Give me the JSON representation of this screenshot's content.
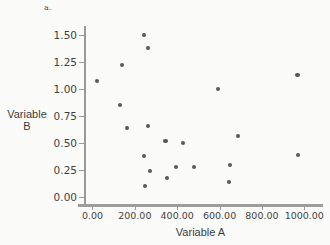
{
  "panel": {
    "label": "a."
  },
  "chart_data": {
    "type": "scatter",
    "title": "",
    "panel_label": "a.",
    "xlabel": "Variable A",
    "ylabel": "Variable B",
    "xlim": [
      -40,
      1060
    ],
    "ylim": [
      -0.06,
      1.58
    ],
    "grid": false,
    "legend": null,
    "point_color": "#585858",
    "axis_color": "#9a9a9a",
    "background_color": "#fbfbfa",
    "xticks": [
      0,
      200,
      400,
      600,
      800,
      1000
    ],
    "xtick_labels": [
      "0.00",
      "200.00",
      "400.00",
      "600.00",
      "800.00",
      "1000.00"
    ],
    "yticks": [
      0.0,
      0.25,
      0.5,
      0.75,
      1.0,
      1.25,
      1.5
    ],
    "ytick_labels": [
      "0.00",
      "0.25",
      "0.50",
      "0.75",
      "1.00",
      "1.25",
      "1.50"
    ],
    "points": [
      {
        "x": 20,
        "y": 1.07
      },
      {
        "x": 140,
        "y": 1.22
      },
      {
        "x": 130,
        "y": 0.85
      },
      {
        "x": 163,
        "y": 0.64
      },
      {
        "x": 245,
        "y": 1.5
      },
      {
        "x": 262,
        "y": 1.38
      },
      {
        "x": 263,
        "y": 0.66
      },
      {
        "x": 243,
        "y": 0.38
      },
      {
        "x": 272,
        "y": 0.245
      },
      {
        "x": 247,
        "y": 0.105
      },
      {
        "x": 345,
        "y": 0.52
      },
      {
        "x": 352,
        "y": 0.18
      },
      {
        "x": 393,
        "y": 0.28
      },
      {
        "x": 428,
        "y": 0.5
      },
      {
        "x": 478,
        "y": 0.28
      },
      {
        "x": 592,
        "y": 1.0
      },
      {
        "x": 688,
        "y": 0.57
      },
      {
        "x": 648,
        "y": 0.3
      },
      {
        "x": 645,
        "y": 0.145
      },
      {
        "x": 968,
        "y": 1.13
      },
      {
        "x": 972,
        "y": 0.39
      }
    ]
  }
}
